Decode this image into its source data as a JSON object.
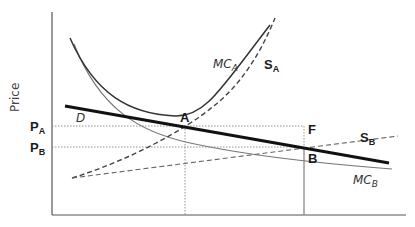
{
  "diagram": {
    "y_axis_title": "Price",
    "price_labels": {
      "pa": {
        "main": "P",
        "sub": "A"
      },
      "pb": {
        "main": "P",
        "sub": "B"
      }
    },
    "curve_labels": {
      "demand": "D",
      "mc_a": {
        "main": "MC",
        "sub": "A"
      },
      "s_a": {
        "main": "S",
        "sub": "A"
      },
      "s_b": {
        "main": "S",
        "sub": "B"
      },
      "mc_b": {
        "main": "MC",
        "sub": "B"
      }
    },
    "point_labels": {
      "a": "A",
      "b": "B",
      "f": "F"
    },
    "colors": {
      "axis": "#555555",
      "demand": "#111111",
      "mc": "#333333",
      "mc_light": "#777777",
      "supply": "#444444",
      "guide": "#888888"
    }
  }
}
